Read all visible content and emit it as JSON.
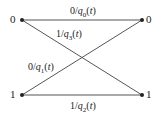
{
  "diagram": {
    "type": "trellis",
    "states_left": [
      "0",
      "1"
    ],
    "states_right": [
      "0",
      "1"
    ],
    "edges": [
      {
        "from": "0",
        "to": "0",
        "input": "0",
        "q": "q",
        "sub": "0",
        "label": "0/q0(t)"
      },
      {
        "from": "0",
        "to": "1",
        "input": "1",
        "q": "q",
        "sub": "3",
        "label": "1/q3(t)"
      },
      {
        "from": "1",
        "to": "0",
        "input": "0",
        "q": "q",
        "sub": "1",
        "label": "0/q1(t)"
      },
      {
        "from": "1",
        "to": "1",
        "input": "1",
        "q": "q",
        "sub": "2",
        "label": "1/q2(t)"
      }
    ],
    "arg": "(t)",
    "line_color": "#555555"
  }
}
